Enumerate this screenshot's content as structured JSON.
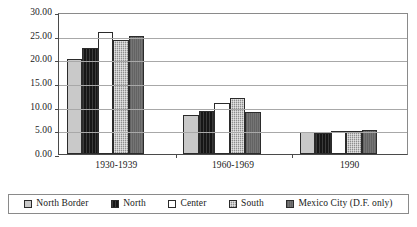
{
  "chart_data": {
    "type": "bar",
    "title": "",
    "subtitle": "",
    "xlabel": "",
    "ylabel": "",
    "categories": [
      "1930-1939",
      "1960-1969",
      "1990"
    ],
    "ylim": [
      0,
      30
    ],
    "y_tick_step": 5,
    "y_ticks": [
      "0.00",
      "5.00",
      "10.00",
      "15.00",
      "20.00",
      "25.00",
      "30.00"
    ],
    "grid": true,
    "legend_position": "bottom",
    "series": [
      {
        "name": "North Border",
        "swatch": "light-gray",
        "color": "#c9c9c9",
        "values": [
          20.1,
          8.2,
          4.7
        ]
      },
      {
        "name": "North",
        "swatch": "black",
        "color": "#161616",
        "values": [
          22.3,
          9.1,
          4.4
        ]
      },
      {
        "name": "Center",
        "swatch": "white",
        "color": "#ffffff",
        "values": [
          25.8,
          10.7,
          4.9
        ]
      },
      {
        "name": "South",
        "swatch": "dotted-gray",
        "color": "#8e8e8e",
        "values": [
          24.1,
          11.9,
          4.9
        ]
      },
      {
        "name": "Mexico City (D.F. only)",
        "swatch": "dark-gray",
        "color": "#6e6e6e",
        "values": [
          24.9,
          8.9,
          5.0
        ]
      }
    ]
  },
  "axis": {
    "y_ticks": [
      {
        "label": "30.00",
        "value": 30
      },
      {
        "label": "25.00",
        "value": 25
      },
      {
        "label": "20.00",
        "value": 20
      },
      {
        "label": "15.00",
        "value": 15
      },
      {
        "label": "10.00",
        "value": 10
      },
      {
        "label": "5.00",
        "value": 5
      },
      {
        "label": "0.00",
        "value": 0
      }
    ]
  },
  "legend": {
    "items": [
      {
        "label": "North Border"
      },
      {
        "label": "North"
      },
      {
        "label": "Center"
      },
      {
        "label": "South"
      },
      {
        "label": "Mexico City (D.F. only)"
      }
    ]
  }
}
